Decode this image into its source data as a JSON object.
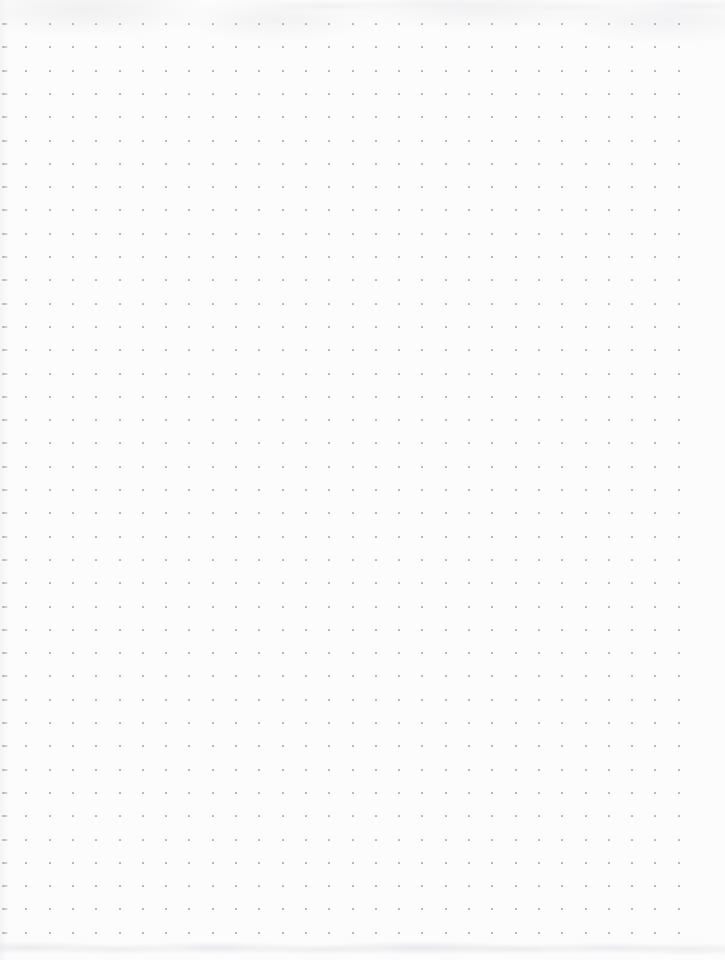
{
  "page": {
    "kind": "dot-grid-notebook-page",
    "width": 725,
    "height": 960,
    "background_color": "#fcfcfc",
    "has_text": false,
    "has_handwriting": false,
    "has_ui_chrome": false
  },
  "grid": {
    "label": "dot grid",
    "columns": 30,
    "rows": 40,
    "origin_x": 3,
    "origin_y": 24,
    "spacing_x": 23.3,
    "spacing_y": 23.3,
    "dot_size_px": 2,
    "dot_color": "#b4b4b9"
  },
  "artifacts": {
    "left_edge_smear": {
      "label": "left edge dot smear",
      "applies_to_column": 0,
      "color": "#a8a8ae"
    },
    "bottom_band": {
      "label": "bottom scan smudge band",
      "top": 936,
      "height": 24,
      "color": "#e8e8ec"
    },
    "top_band": {
      "label": "top scan smudge band",
      "top": 0,
      "height": 20,
      "color": "#efeff2"
    }
  }
}
